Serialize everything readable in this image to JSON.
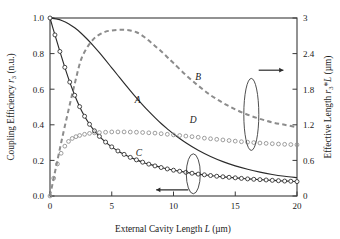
{
  "chart_data": {
    "type": "line",
    "title": "",
    "xlabel": "External Cavity Length L (µm)",
    "ylabel": "Coupling Efficiency r3 (n.u.)",
    "ylabel_right": "Effective Length r3*L (µm)",
    "xlim": [
      0,
      20
    ],
    "ylim": [
      0.0,
      1.0
    ],
    "ylim_right": [
      0,
      3
    ],
    "xticks": [
      "0",
      "5",
      "10",
      "15",
      "20"
    ],
    "xtick_values": [
      0,
      5,
      10,
      15,
      20
    ],
    "yticks": [
      "0.0",
      "0.2",
      "0.4",
      "0.6",
      "0.8",
      "1.0"
    ],
    "ytick_values": [
      0.0,
      0.2,
      0.4,
      0.6,
      0.8,
      1.0
    ],
    "yticks_right": [
      "0",
      "0.6",
      "1.2",
      "1.8",
      "2.4",
      "3"
    ],
    "ytick_right_values": [
      0,
      0.6,
      1.2,
      1.8,
      2.4,
      3.0
    ],
    "grid": false,
    "legend": "inline-labels",
    "annotations": [
      {
        "name": "arrow-right",
        "text": "→",
        "meaning": "curves B and D read on right axis"
      },
      {
        "name": "arrow-left",
        "text": "←",
        "meaning": "curves A and C read on left axis"
      },
      {
        "name": "ellipse-right",
        "meaning": "groups curves B and D"
      },
      {
        "name": "ellipse-left",
        "meaning": "groups curves A and C"
      }
    ],
    "series": [
      {
        "name": "A",
        "label": "A",
        "axis": "left",
        "style": "solid",
        "color": "#2b2b2b",
        "marker": "none",
        "label_pos": {
          "x": 7.1,
          "y": 0.52
        },
        "x": [
          0,
          0.5,
          1,
          1.5,
          2,
          2.5,
          3,
          3.5,
          4,
          4.5,
          5,
          5.5,
          6,
          6.5,
          7,
          7.5,
          8,
          8.5,
          9,
          9.5,
          10,
          11,
          12,
          13,
          14,
          15,
          16,
          17,
          18,
          19,
          20
        ],
        "y": [
          1.0,
          0.995,
          0.985,
          0.968,
          0.945,
          0.916,
          0.882,
          0.845,
          0.805,
          0.763,
          0.72,
          0.677,
          0.634,
          0.592,
          0.551,
          0.512,
          0.475,
          0.44,
          0.407,
          0.377,
          0.349,
          0.299,
          0.257,
          0.222,
          0.193,
          0.169,
          0.15,
          0.134,
          0.121,
          0.111,
          0.103
        ]
      },
      {
        "name": "B",
        "label": "B",
        "axis": "right",
        "style": "dashed",
        "color": "#8c8c8c",
        "marker": "none",
        "label_pos": {
          "x": 12.0,
          "y": 1.95
        },
        "x": [
          0,
          0.5,
          1,
          1.5,
          2,
          2.5,
          3,
          3.5,
          4,
          4.5,
          5,
          5.5,
          6,
          6.5,
          7,
          7.5,
          8,
          8.5,
          9,
          9.5,
          10,
          11,
          12,
          13,
          14,
          15,
          16,
          17,
          18,
          19,
          20
        ],
        "y": [
          0.0,
          0.5,
          0.99,
          1.45,
          1.89,
          2.29,
          2.5,
          2.64,
          2.72,
          2.77,
          2.79,
          2.8,
          2.8,
          2.79,
          2.76,
          2.7,
          2.62,
          2.53,
          2.44,
          2.34,
          2.24,
          2.04,
          1.86,
          1.7,
          1.57,
          1.46,
          1.37,
          1.3,
          1.24,
          1.2,
          1.16
        ]
      },
      {
        "name": "C",
        "label": "C",
        "axis": "left",
        "style": "solid",
        "color": "#2b2b2b",
        "marker": "circle",
        "label_pos": {
          "x": 7.2,
          "y": 0.225
        },
        "x": [
          0,
          0.4,
          0.8,
          1.2,
          1.6,
          2,
          2.4,
          2.8,
          3.2,
          3.6,
          4,
          4.5,
          5,
          5.5,
          6,
          6.5,
          7,
          7.5,
          8,
          8.5,
          9,
          9.5,
          10,
          10.5,
          11,
          11.5,
          12,
          12.5,
          13,
          13.5,
          14,
          14.5,
          15,
          15.5,
          16,
          16.5,
          17,
          17.5,
          18,
          18.5,
          19,
          19.5,
          20
        ],
        "y": [
          1.0,
          0.905,
          0.812,
          0.723,
          0.64,
          0.566,
          0.502,
          0.448,
          0.403,
          0.366,
          0.335,
          0.303,
          0.276,
          0.253,
          0.234,
          0.217,
          0.203,
          0.19,
          0.179,
          0.169,
          0.16,
          0.152,
          0.145,
          0.139,
          0.133,
          0.128,
          0.123,
          0.119,
          0.115,
          0.111,
          0.108,
          0.105,
          0.102,
          0.099,
          0.096,
          0.094,
          0.092,
          0.09,
          0.088,
          0.086,
          0.084,
          0.083,
          0.081
        ]
      },
      {
        "name": "D",
        "label": "D",
        "axis": "right",
        "style": "dotted-markers",
        "color": "#8c8c8c",
        "marker": "circle",
        "label_pos": {
          "x": 11.6,
          "y": 1.23
        },
        "x": [
          0,
          0.3,
          0.6,
          0.9,
          1.2,
          1.5,
          1.8,
          2.1,
          2.4,
          2.8,
          3.2,
          3.6,
          4,
          4.5,
          5,
          5.5,
          6,
          6.5,
          7,
          7.5,
          8,
          8.5,
          9,
          9.5,
          10,
          10.5,
          11,
          11.5,
          12,
          12.5,
          13,
          13.5,
          14,
          14.5,
          15,
          15.5,
          16,
          16.5,
          17,
          17.5,
          18,
          18.5,
          19,
          19.5,
          20
        ],
        "y": [
          0.0,
          0.3,
          0.54,
          0.72,
          0.84,
          0.92,
          0.97,
          1.0,
          1.02,
          1.04,
          1.055,
          1.065,
          1.07,
          1.075,
          1.08,
          1.08,
          1.08,
          1.078,
          1.075,
          1.07,
          1.065,
          1.06,
          1.05,
          1.04,
          1.03,
          1.02,
          1.01,
          1.0,
          0.99,
          0.975,
          0.965,
          0.955,
          0.945,
          0.935,
          0.925,
          0.915,
          0.907,
          0.9,
          0.893,
          0.887,
          0.881,
          0.876,
          0.871,
          0.867,
          0.863
        ]
      }
    ]
  }
}
